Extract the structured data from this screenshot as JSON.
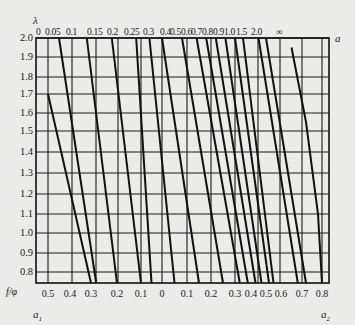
{
  "chart_data": {
    "type": "line",
    "title": "",
    "ylabel": "f/φ",
    "top_param_label": "λ",
    "right_label": "a",
    "xlabel_left": "a1",
    "xlabel_right": "a2",
    "ylim": [
      0.75,
      2.0
    ],
    "y_ticks": [
      "2.0",
      "1.9",
      "1.8",
      "1.7",
      "1.6",
      "1.5",
      "1.4",
      "1.3",
      "1.2",
      "1.1",
      "1.0",
      "0.9",
      "0.8"
    ],
    "x_ticks_bottom": [
      "0.5",
      "0.4",
      "0.3",
      "0.2",
      "0.1",
      "0",
      "0.1",
      "0.2",
      "0.3",
      "0.4",
      "0.5",
      "0.6",
      "0.7",
      "0.8"
    ],
    "x_ticks_top_lambda": [
      "0",
      "0.05",
      "0.1",
      "0.15",
      "0.2",
      "0.25",
      "0.3",
      "0.4",
      "0.5",
      "0.6",
      "0.7",
      "0.8",
      "0.9",
      "1.0",
      "1.5",
      "2.0",
      "∞"
    ],
    "grid": true,
    "series": [
      {
        "name": "λ=0",
        "points": [
          [
            0.5,
            1.7
          ],
          [
            0.3,
            0.75
          ]
        ]
      },
      {
        "name": "λ=0.05",
        "points": [
          [
            0.45,
            2.0
          ],
          [
            0.28,
            0.75
          ]
        ]
      },
      {
        "name": "λ=0.1",
        "points": [
          [
            0.32,
            2.0
          ],
          [
            0.2,
            0.75
          ]
        ]
      },
      {
        "name": "λ=0.15",
        "points": [
          [
            0.22,
            2.0
          ],
          [
            0.1,
            0.75
          ]
        ]
      },
      {
        "name": "λ=0.2",
        "points": [
          [
            0.12,
            2.0
          ],
          [
            0.05,
            0.75
          ]
        ]
      },
      {
        "name": "λ=0.25",
        "points": [
          [
            0.06,
            2.0
          ],
          [
            -0.05,
            0.75
          ]
        ]
      },
      {
        "name": "λ=0.3",
        "points": [
          [
            0.0,
            2.0
          ],
          [
            -0.15,
            0.75
          ]
        ]
      },
      {
        "name": "λ=0.4",
        "points": [
          [
            -0.08,
            2.0
          ],
          [
            -0.25,
            0.75
          ]
        ]
      },
      {
        "name": "λ=0.5",
        "points": [
          [
            -0.14,
            2.0
          ],
          [
            -0.33,
            0.75
          ]
        ]
      },
      {
        "name": "λ=0.6",
        "points": [
          [
            -0.18,
            2.0
          ],
          [
            -0.38,
            0.75
          ]
        ]
      },
      {
        "name": "λ=0.7",
        "points": [
          [
            -0.22,
            2.0
          ],
          [
            -0.43,
            0.75
          ]
        ]
      },
      {
        "name": "λ=0.8",
        "points": [
          [
            -0.26,
            2.0
          ],
          [
            -0.47,
            0.75
          ]
        ]
      },
      {
        "name": "λ=0.9",
        "points": [
          [
            -0.3,
            2.0
          ],
          [
            -0.52,
            0.75
          ]
        ]
      },
      {
        "name": "λ=1.0",
        "points": [
          [
            -0.35,
            2.0
          ],
          [
            -0.55,
            0.75
          ]
        ]
      },
      {
        "name": "λ=1.5",
        "points": [
          [
            -0.45,
            2.0
          ],
          [
            -0.68,
            0.75
          ]
        ]
      },
      {
        "name": "λ=2.0",
        "points": [
          [
            -0.5,
            2.0
          ],
          [
            -0.72,
            0.75
          ]
        ]
      },
      {
        "name": "λ=∞",
        "points": [
          [
            -0.65,
            1.95
          ],
          [
            -0.72,
            1.55
          ],
          [
            -0.78,
            1.1
          ],
          [
            -0.8,
            0.75
          ]
        ]
      }
    ]
  },
  "labels": {
    "lambda": "λ",
    "a": "a",
    "f_phi": "f/φ",
    "a1": "a",
    "a1_sub": "1",
    "a2": "a",
    "a2_sub": "2"
  }
}
